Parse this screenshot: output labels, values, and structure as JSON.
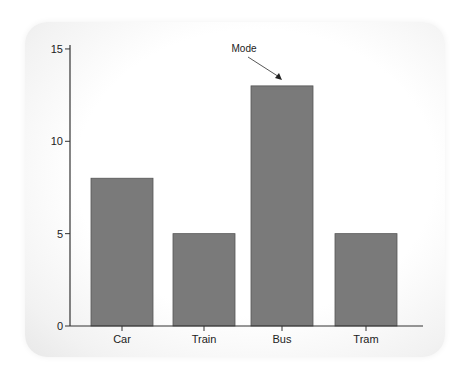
{
  "chart_data": {
    "type": "bar",
    "title": "",
    "xlabel": "",
    "ylabel": "",
    "categories": [
      "Car",
      "Train",
      "Bus",
      "Tram"
    ],
    "values": [
      8,
      5,
      13,
      5
    ],
    "ylim": [
      0,
      15.5
    ],
    "yticks": [
      0,
      5,
      10,
      15
    ],
    "grid": false,
    "bar_color": "#7a7a7a",
    "annotations": [
      {
        "text": "Mode",
        "target": "Bus",
        "value": 13
      }
    ]
  }
}
